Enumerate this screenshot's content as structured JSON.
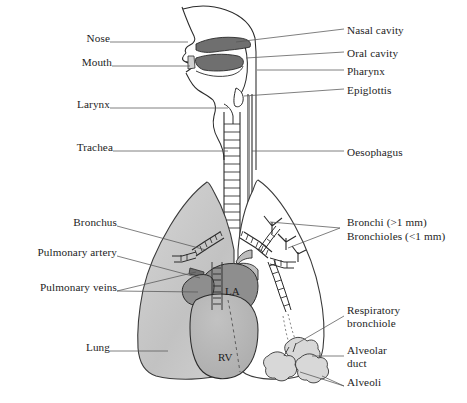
{
  "figure": {
    "background_color": "#ffffff",
    "line_color": "#2b2b2b",
    "text_color": "#1d1d1d",
    "leader_color": "#555555"
  },
  "palette": {
    "lung_fill_light": "#d2d2d2",
    "lung_fill_mid": "#b9b9b9",
    "cavity_dark": "#6f6f6f",
    "atrium_dark": "#8e8e8e",
    "ventricle_mid": "#b4b4b4",
    "artery_gray": "#bdbdbd",
    "alveoli_fill": "#d8d8d8",
    "white": "#ffffff"
  },
  "labels_left": [
    {
      "id": "nose",
      "text": "Nose",
      "x": 78,
      "y": 38
    },
    {
      "id": "mouth",
      "text": "Mouth",
      "x": 71,
      "y": 62
    },
    {
      "id": "larynx",
      "text": "Larynx",
      "x": 66,
      "y": 104
    },
    {
      "id": "trachea",
      "text": "Trachea",
      "x": 60,
      "y": 147
    },
    {
      "id": "bronchus",
      "text": "Bronchus",
      "x": 53,
      "y": 222
    },
    {
      "id": "pulmonary-artery",
      "text": "Pulmonary artery",
      "x": 15,
      "y": 252
    },
    {
      "id": "pulmonary-veins",
      "text": "Pulmonary veins",
      "x": 20,
      "y": 287
    },
    {
      "id": "lung",
      "text": "Lung",
      "x": 78,
      "y": 347
    }
  ],
  "labels_right": [
    {
      "id": "nasal-cavity",
      "text": "Nasal cavity",
      "x": 347,
      "y": 25
    },
    {
      "id": "oral-cavity",
      "text": "Oral cavity",
      "x": 347,
      "y": 48
    },
    {
      "id": "pharynx",
      "text": "Pharynx",
      "x": 347,
      "y": 66
    },
    {
      "id": "epiglottis",
      "text": "Epiglottis",
      "x": 347,
      "y": 85
    },
    {
      "id": "oesophagus",
      "text": "Oesophagus",
      "x": 347,
      "y": 147
    },
    {
      "id": "bronchi",
      "text": "Bronchi (>1 mm)",
      "x": 347,
      "y": 220
    },
    {
      "id": "bronchioles",
      "text": "Bronchioles (<1 mm)",
      "x": 347,
      "y": 234
    },
    {
      "id": "respiratory-bronchiole",
      "text": "Respiratory\nbronchiole",
      "x": 347,
      "y": 310
    },
    {
      "id": "alveolar-duct",
      "text": "Alveolar\nduct",
      "x": 347,
      "y": 350
    },
    {
      "id": "alveoli",
      "text": "Alveoli",
      "x": 347,
      "y": 382
    }
  ],
  "inline_labels": [
    {
      "id": "left-atrium",
      "text": "LA",
      "x": 231,
      "y": 292
    },
    {
      "id": "right-ventricle",
      "text": "RV",
      "x": 224,
      "y": 358
    }
  ]
}
